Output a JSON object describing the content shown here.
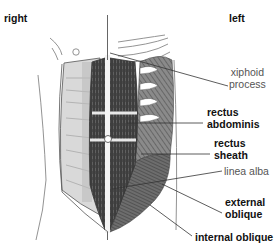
{
  "orientation": {
    "right": "right",
    "left": "left"
  },
  "labels": {
    "xiphoid_process": [
      "xiphoid",
      "process"
    ],
    "rectus_abdominis": [
      "rectus",
      "abdominis"
    ],
    "rectus_sheath": [
      "rectus",
      "sheath"
    ],
    "linea_alba": "linea alba",
    "external_oblique": [
      "external",
      "oblique"
    ],
    "internal_oblique": "internal oblique"
  },
  "colors": {
    "muscle_dark": "#3a3a3a",
    "muscle_mid": "#6b6b6b",
    "sheath_light": "#d8d8d8",
    "outline": "#555555",
    "leader_line": "#333333",
    "background": "#ffffff"
  }
}
